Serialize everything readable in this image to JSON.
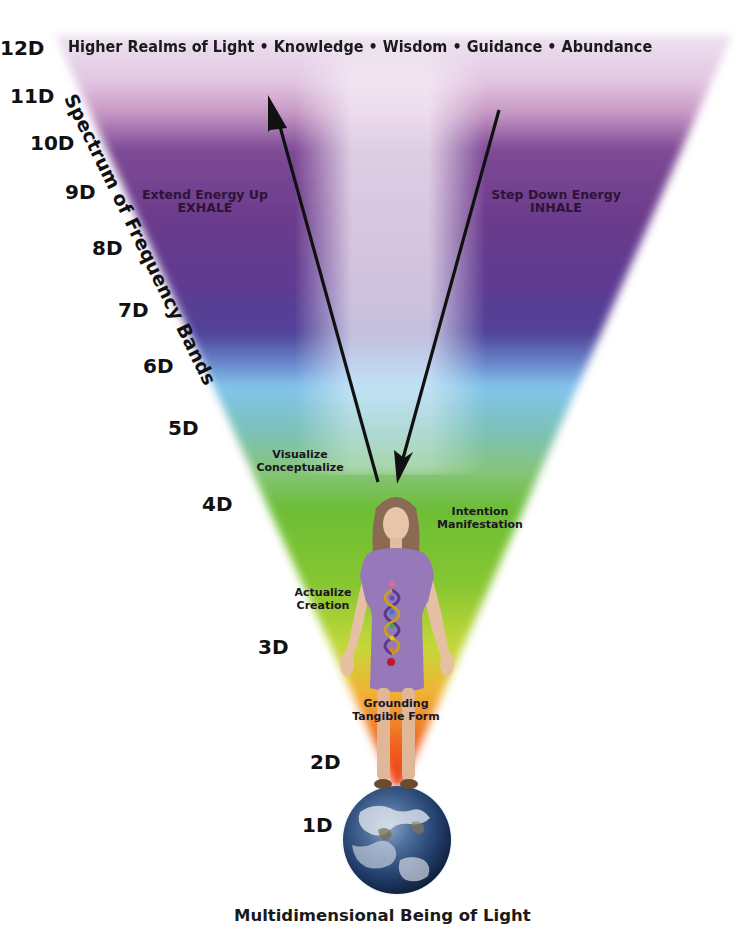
{
  "diagram": {
    "top_title": "Higher Realms of Light • Knowledge • Wisdom • Guidance • Abundance",
    "bottom_title": "Multidimensional Being of Light",
    "axis_label": "Spectrum of Frequency Bands",
    "dimensions": [
      {
        "label": "12D",
        "x": 0,
        "y": 37,
        "color": "#e8dcec"
      },
      {
        "label": "11D",
        "x": 10,
        "y": 80,
        "color": "#d2a8cf"
      },
      {
        "label": "10D",
        "x": 30,
        "y": 133,
        "color": "#7c4a95"
      },
      {
        "label": "9D",
        "x": 65,
        "y": 181,
        "color": "#6a3b8c"
      },
      {
        "label": "8D",
        "x": 92,
        "y": 238,
        "color": "#5e3e92"
      },
      {
        "label": "7D",
        "x": 118,
        "y": 299,
        "color": "#4e4399"
      },
      {
        "label": "6D",
        "x": 143,
        "y": 355,
        "color": "#78bce8"
      },
      {
        "label": "5D",
        "x": 168,
        "y": 418,
        "color": "#76c0a8"
      },
      {
        "label": "4D",
        "x": 202,
        "y": 494,
        "color": "#6cbd38"
      },
      {
        "label": "3D",
        "x": 258,
        "y": 636,
        "color": "#b8d63a"
      },
      {
        "label": "2D",
        "x": 310,
        "y": 751,
        "color": "#ee4a1a"
      },
      {
        "label": "1D",
        "x": 302,
        "y": 814,
        "color": "#2a4a7a"
      }
    ],
    "arrows": [
      {
        "name": "up-arrow",
        "direction": "up",
        "label_line1": "Extend Energy Up",
        "label_line2": "EXHALE"
      },
      {
        "name": "down-arrow",
        "direction": "down",
        "label_line1": "Step Down Energy",
        "label_line2": "INHALE"
      }
    ],
    "annotations": {
      "visualize": {
        "line1": "Visualize",
        "line2": "Conceptualize"
      },
      "intention": {
        "line1": "Intention",
        "line2": "Manifestation"
      },
      "actualize": {
        "line1": "Actualize",
        "line2": "Creation"
      },
      "grounding": {
        "line1": "Grounding",
        "line2": "Tangible Form"
      }
    },
    "figure": "woman-figure-with-dna-chakra-helix",
    "base": "earth-globe"
  }
}
